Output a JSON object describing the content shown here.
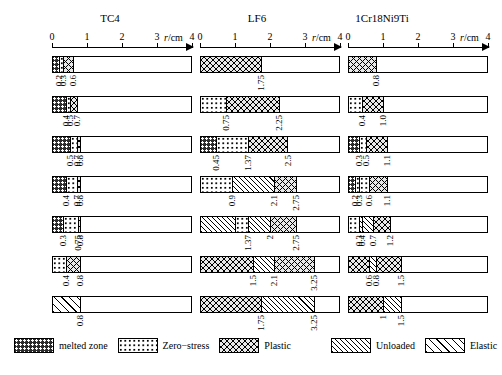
{
  "axis": {
    "ticks": [
      "0",
      "1",
      "2",
      "3",
      "4"
    ],
    "unit": "r/cm",
    "unit_italic": "r",
    "unit_rest": "/cm",
    "max": 4
  },
  "legend": {
    "items": [
      {
        "key": "melted",
        "label": "melted zone",
        "pattern": "p-melted"
      },
      {
        "key": "zero",
        "label": "Zero−stress",
        "pattern": "p-zero"
      },
      {
        "key": "plastic",
        "label": "Plastic",
        "pattern": "p-plastic"
      },
      {
        "key": "unloaded",
        "label": "Unloaded",
        "pattern": "p-unloaded"
      },
      {
        "key": "elastic",
        "label": "Elastic",
        "pattern": "p-elastic"
      }
    ]
  },
  "columns": [
    {
      "title": "TC4",
      "rows": [
        {
          "time": "−5.5sec.",
          "boundaries": [
            "0.2",
            "0.3",
            "0.6"
          ],
          "segments": [
            {
              "zone": "melted",
              "end": 0.2
            },
            {
              "zone": "zero",
              "end": 0.3
            },
            {
              "zone": "plastic",
              "end": 0.6
            },
            {
              "zone": "none",
              "end": 4
            }
          ]
        },
        {
          "time": "−2.5sec.",
          "boundaries": [
            "0.4",
            "0.5",
            "0.7"
          ],
          "segments": [
            {
              "zone": "melted",
              "end": 0.4
            },
            {
              "zone": "zero",
              "end": 0.5
            },
            {
              "zone": "plastic",
              "end": 0.7
            },
            {
              "zone": "none",
              "end": 4
            }
          ]
        },
        {
          "time": "t=0",
          "time_italic": "t",
          "time_rest": "=0",
          "boundaries": [
            "0.5",
            "0.7",
            "0.8"
          ],
          "segments": [
            {
              "zone": "melted",
              "end": 0.5
            },
            {
              "zone": "zero",
              "end": 0.7
            },
            {
              "zone": "plastic",
              "end": 0.8
            },
            {
              "zone": "none",
              "end": 4
            }
          ]
        },
        {
          "time": "0.46sec.",
          "boundaries": [
            "0.4",
            "0.7",
            "0.8"
          ],
          "segments": [
            {
              "zone": "melted",
              "end": 0.4
            },
            {
              "zone": "zero",
              "end": 0.7
            },
            {
              "zone": "plastic",
              "end": 0.8
            },
            {
              "zone": "none",
              "end": 4
            }
          ]
        },
        {
          "time": "1.76sec.",
          "boundaries": [
            "0.3",
            "0.75",
            "0.8"
          ],
          "segments": [
            {
              "zone": "melted",
              "end": 0.3
            },
            {
              "zone": "zero",
              "end": 0.75
            },
            {
              "zone": "plastic",
              "end": 0.8
            },
            {
              "zone": "none",
              "end": 4
            }
          ]
        },
        {
          "time": "5.52sec.",
          "boundaries": [
            "0.4",
            "0.8"
          ],
          "segments": [
            {
              "zone": "zero",
              "end": 0.4
            },
            {
              "zone": "plastic",
              "end": 0.8
            },
            {
              "zone": "none",
              "end": 4
            }
          ]
        },
        {
          "time": "∞",
          "boundaries": [
            "0.8"
          ],
          "segments": [
            {
              "zone": "elastic",
              "end": 0.8
            },
            {
              "zone": "none",
              "end": 4
            }
          ]
        }
      ]
    },
    {
      "title": "LF6",
      "rows": [
        {
          "time": "−5.0sec.",
          "boundaries": [
            "1.75"
          ],
          "segments": [
            {
              "zone": "plastic",
              "end": 1.75
            },
            {
              "zone": "none",
              "end": 4
            }
          ]
        },
        {
          "time": "−2.0sec.",
          "boundaries": [
            "0.75",
            "2.25"
          ],
          "segments": [
            {
              "zone": "zero",
              "end": 0.75
            },
            {
              "zone": "plastic",
              "end": 2.25
            },
            {
              "zone": "none",
              "end": 4
            }
          ]
        },
        {
          "time": "t=0",
          "time_italic": "t",
          "time_rest": "=0",
          "boundaries": [
            "0.45",
            "1.37",
            "2.5"
          ],
          "segments": [
            {
              "zone": "melted",
              "end": 0.45
            },
            {
              "zone": "zero",
              "end": 1.37
            },
            {
              "zone": "plastic",
              "end": 2.5
            },
            {
              "zone": "none",
              "end": 4
            }
          ]
        },
        {
          "time": "0.7sec.",
          "boundaries": [
            "0.9",
            "2.1",
            "2.75"
          ],
          "segments": [
            {
              "zone": "zero",
              "end": 0.9
            },
            {
              "zone": "unloaded",
              "end": 2.1
            },
            {
              "zone": "plastic",
              "end": 2.75
            },
            {
              "zone": "none",
              "end": 4
            }
          ]
        },
        {
          "time": "2sec.",
          "boundaries": [
            "1.37",
            "2",
            "2.75"
          ],
          "segments": [
            {
              "zone": "unloaded",
              "end": 1.0
            },
            {
              "zone": "zero",
              "end": 1.37
            },
            {
              "zone": "unloaded",
              "end": 2.0
            },
            {
              "zone": "plastic",
              "end": 2.75
            },
            {
              "zone": "none",
              "end": 4
            }
          ]
        },
        {
          "time": "6.5sec.",
          "boundaries": [
            "1.5",
            "2.1",
            "3.25"
          ],
          "segments": [
            {
              "zone": "plastic",
              "end": 1.5
            },
            {
              "zone": "unloaded",
              "end": 2.1
            },
            {
              "zone": "plastic",
              "end": 3.25
            },
            {
              "zone": "none",
              "end": 4
            }
          ]
        },
        {
          "time": "∞",
          "boundaries": [
            "1.75",
            "3.25"
          ],
          "segments": [
            {
              "zone": "plastic",
              "end": 1.75
            },
            {
              "zone": "unloaded",
              "end": 3.25
            },
            {
              "zone": "none",
              "end": 4
            }
          ]
        }
      ]
    },
    {
      "title": "1Cr18Ni9Ti",
      "rows": [
        {
          "time": "−5.5sec.",
          "boundaries": [
            "0.8"
          ],
          "segments": [
            {
              "zone": "plastic",
              "end": 0.8
            },
            {
              "zone": "none",
              "end": 4
            }
          ]
        },
        {
          "time": "−2.5sec.",
          "boundaries": [
            "0.4",
            "1.0"
          ],
          "segments": [
            {
              "zone": "zero",
              "end": 0.4
            },
            {
              "zone": "plastic",
              "end": 1.0
            },
            {
              "zone": "none",
              "end": 4
            }
          ]
        },
        {
          "time": "t=0",
          "time_italic": "t",
          "time_rest": "=0",
          "boundaries": [
            "0.3",
            "0.5",
            "1.1"
          ],
          "segments": [
            {
              "zone": "melted",
              "end": 0.3
            },
            {
              "zone": "zero",
              "end": 0.5
            },
            {
              "zone": "plastic",
              "end": 1.1
            },
            {
              "zone": "none",
              "end": 4
            }
          ]
        },
        {
          "time": "0.45sec.",
          "boundaries": [
            "0.2",
            "0.3",
            "0.6",
            "1.1"
          ],
          "segments": [
            {
              "zone": "melted",
              "end": 0.2
            },
            {
              "zone": "zero",
              "end": 0.3
            },
            {
              "zone": "zero",
              "end": 0.6
            },
            {
              "zone": "plastic",
              "end": 1.1
            },
            {
              "zone": "none",
              "end": 4
            }
          ]
        },
        {
          "time": "1.76sec.",
          "boundaries": [
            "0.3",
            "0.4",
            "0.7",
            "1.2"
          ],
          "segments": [
            {
              "zone": "zero",
              "end": 0.3
            },
            {
              "zone": "unloaded",
              "end": 0.4
            },
            {
              "zone": "unloaded",
              "end": 0.7
            },
            {
              "zone": "plastic",
              "end": 1.2
            },
            {
              "zone": "none",
              "end": 4
            }
          ]
        },
        {
          "time": "5.5sec.",
          "boundaries": [
            "0.6",
            "0.8",
            "1.5"
          ],
          "segments": [
            {
              "zone": "plastic",
              "end": 0.6
            },
            {
              "zone": "unloaded",
              "end": 0.8
            },
            {
              "zone": "plastic",
              "end": 1.5
            },
            {
              "zone": "none",
              "end": 4
            }
          ]
        },
        {
          "time": "∞",
          "boundaries": [
            "1",
            "1.5"
          ],
          "segments": [
            {
              "zone": "plastic",
              "end": 1.0
            },
            {
              "zone": "unloaded",
              "end": 1.5
            },
            {
              "zone": "none",
              "end": 4
            }
          ]
        }
      ]
    }
  ],
  "chart_data": {
    "type": "bar",
    "title": "",
    "xlabel": "r/cm",
    "ylabel": "",
    "xlim": [
      0,
      4
    ],
    "grid": false,
    "legend_position": "bottom",
    "note": "Stacked horizontal zone bars: radial extent of melted / zero-stress / plastic / unloaded / elastic zones versus time for three materials"
  }
}
